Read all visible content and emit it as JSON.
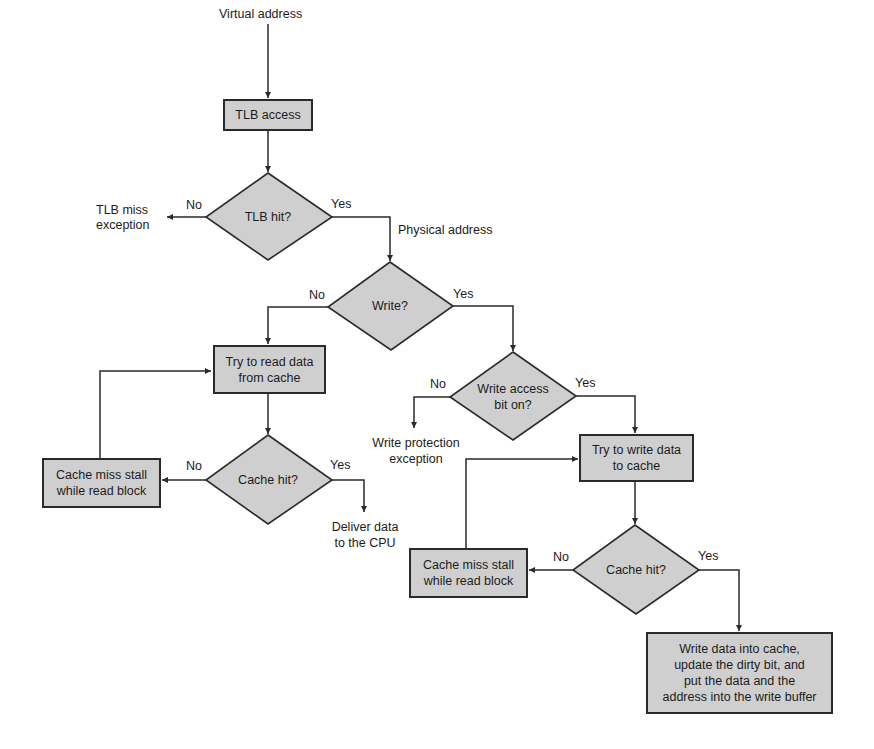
{
  "diagram": {
    "type": "flowchart",
    "start_label": "Virtual address",
    "nodes": {
      "tlb_access": "TLB access",
      "tlb_hit": "TLB hit?",
      "write_q": "Write?",
      "read_cache": [
        "Try to read data",
        "from cache"
      ],
      "read_cache_hit": "Cache hit?",
      "read_miss_stall": [
        "Cache miss stall",
        "while read block"
      ],
      "write_access": [
        "Write access",
        "bit on?"
      ],
      "write_cache": [
        "Try to write data",
        "to cache"
      ],
      "write_cache_hit": "Cache hit?",
      "write_miss_stall": [
        "Cache miss stall",
        "while read block"
      ],
      "write_done": [
        "Write data into cache,",
        "update the dirty bit, and",
        "put the data and the",
        "address into the write buffer"
      ]
    },
    "terminals": {
      "tlb_miss": [
        "TLB miss",
        "exception"
      ],
      "write_protection": [
        "Write protection",
        "exception"
      ],
      "deliver": [
        "Deliver data",
        "to the CPU"
      ]
    },
    "edge_labels": {
      "physical_address": "Physical address",
      "no": "No",
      "yes": "Yes"
    },
    "colors": {
      "node_fill": "#cfcfcf",
      "stroke": "#2a2a2a",
      "background": "#ffffff"
    }
  }
}
